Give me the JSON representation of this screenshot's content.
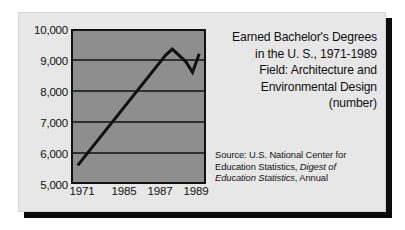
{
  "chart_data": {
    "type": "line",
    "title": "Earned Bachelor's Degrees in the U. S., 1971-1989 Field: Architecture and Environmental Design (number)",
    "title_lines": [
      "Earned Bachelor's Degrees",
      "in the U. S., 1971-1989",
      "Field: Architecture and",
      "Environmental Design",
      "(number)"
    ],
    "xlabel": "",
    "ylabel": "",
    "ylim": [
      5000,
      10000
    ],
    "grid": true,
    "legend": "none",
    "y_ticks": [
      10000,
      9000,
      8000,
      7000,
      6000,
      5000
    ],
    "y_tick_labels": [
      "10,000",
      "9,000",
      "8,000",
      "7,000",
      "6,000",
      "5,000"
    ],
    "x_tick_labels": [
      "1971",
      "1985",
      "1987",
      "1989"
    ],
    "x_tick_positions": [
      1971,
      1985,
      1987,
      1989
    ],
    "xlim": [
      1970,
      1990
    ],
    "series": [
      {
        "name": "Architecture and Environmental Design bachelor's degrees",
        "x": [
          1971,
          1984,
          1985,
          1987,
          1988,
          1989
        ],
        "values": [
          5600,
          9150,
          9350,
          8950,
          8600,
          9200
        ]
      }
    ],
    "line_color": "#111111",
    "plot_background": "#8e8e8e",
    "card_background": "#e7e7e7",
    "gridline_color": "#111111"
  },
  "source": {
    "lines": [
      {
        "text": "Source: U.S. National Center for",
        "italic_from": null
      },
      {
        "text": "Education Statistics, ",
        "italic_text": "Digest of"
      },
      {
        "italic_text": "Education Statistics",
        "text": ", Annual"
      }
    ],
    "line1": "Source: U.S. National Center for",
    "line2_plain": "Education Statistics, ",
    "line2_italic": "Digest of",
    "line3_italic": "Education Statistics",
    "line3_plain": ", Annual"
  }
}
